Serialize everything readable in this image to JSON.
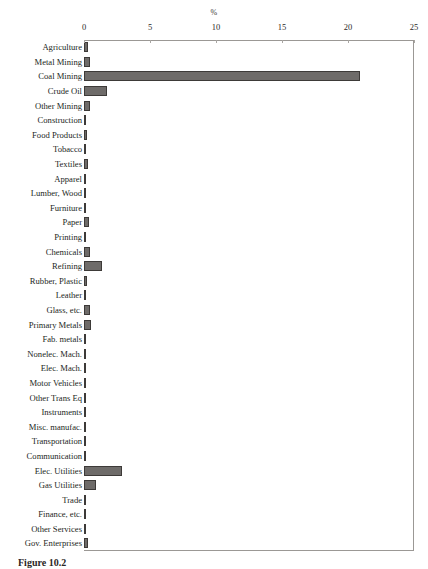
{
  "figure": {
    "caption_label": "Figure 10.2",
    "caption_text": "Figure 10.2  Title"
  },
  "chart_data": {
    "type": "bar",
    "orientation": "horizontal",
    "title": "",
    "xlabel": "%",
    "ylabel": "",
    "xlim": [
      0,
      25
    ],
    "xticks": [
      0,
      5,
      10,
      15,
      20,
      25
    ],
    "xticklabels": [
      "0",
      "5",
      "10",
      "15",
      "20",
      "25"
    ],
    "grid": false,
    "legend": null,
    "bar_color": "#6e6b69",
    "bar_edge_color": "#3d3a38",
    "axis_color": "#9b9895",
    "categories": [
      "Agriculture",
      "Metal Mining",
      "Coal Mining",
      "Crude Oil",
      "Other Mining",
      "Construction",
      "Food Products",
      "Tobacco",
      "Textiles",
      "Apparel",
      "Lumber, Wood",
      "Furniture",
      "Paper",
      "Printing",
      "Chemicals",
      "Refining",
      "Rubber, Plastic",
      "Leather",
      "Glass, etc.",
      "Primary Metals",
      "Fab. metals",
      "Nonelec. Mach.",
      "Elec. Mach.",
      "Motor Vehicles",
      "Other Trans Eq",
      "Instruments",
      "Misc. manufac.",
      "Transportation",
      "Communication",
      "Elec. Utilities",
      "Gas Utilities",
      "Trade",
      "Finance, etc.",
      "Other Services",
      "Gov. Enterprises"
    ],
    "values": [
      0.3,
      0.42,
      20.9,
      1.75,
      0.45,
      0.16,
      0.26,
      0.1,
      0.34,
      0.12,
      0.14,
      0.1,
      0.4,
      0.12,
      0.45,
      1.35,
      0.2,
      0.1,
      0.45,
      0.5,
      0.18,
      0.12,
      0.1,
      0.12,
      0.1,
      0.09,
      0.09,
      0.18,
      0.1,
      2.9,
      0.9,
      0.14,
      0.09,
      0.14,
      0.3
    ]
  }
}
